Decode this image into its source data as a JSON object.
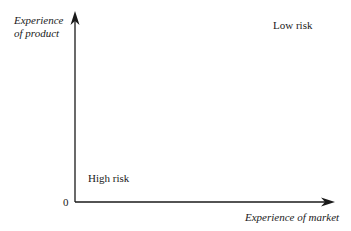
{
  "diagram": {
    "y_axis_label_line1": "Experience",
    "y_axis_label_line2": "of product",
    "x_axis_label": "Experience of market",
    "origin_label": "0",
    "quadrant_top_right": "Low risk",
    "quadrant_bottom_left": "High risk"
  }
}
